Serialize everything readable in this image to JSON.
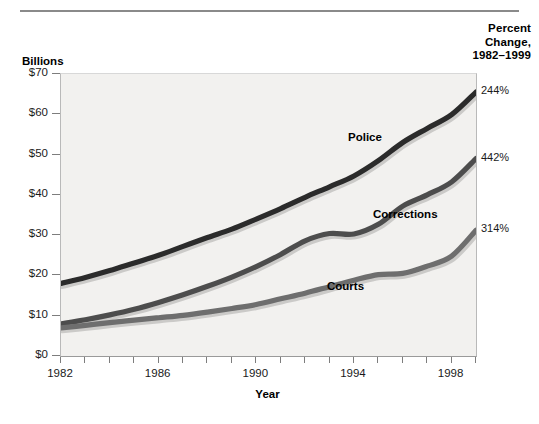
{
  "header": {
    "corner_title_line1": "Percent",
    "corner_title_line2": "Change,",
    "corner_title_line3": "1982–1999"
  },
  "axes": {
    "y_axis_title": "Billions",
    "x_axis_title": "Year",
    "y_tick_labels": [
      "$70",
      "$60",
      "$50",
      "$40",
      "$30",
      "$20",
      "$10",
      "$0"
    ],
    "x_tick_labels": [
      "1982",
      "1986",
      "1990",
      "1994",
      "1998"
    ]
  },
  "series_labels": {
    "police": "Police",
    "corrections": "Corrections",
    "courts": "Courts"
  },
  "percent_change": {
    "police": "244%",
    "corrections": "442%",
    "courts": "314%"
  },
  "colors": {
    "police": "#2b2b2b",
    "corrections": "#4d4d4d",
    "courts": "#6e6e6e",
    "plot_background": "#f2f1ef",
    "rule": "#8a8a8a"
  },
  "chart_data": {
    "type": "line",
    "title": "",
    "xlabel": "Year",
    "ylabel": "Billions",
    "xlim": [
      1982,
      1999
    ],
    "ylim": [
      0,
      70
    ],
    "grid": false,
    "legend": "inline-labels",
    "x": [
      1982,
      1983,
      1984,
      1985,
      1986,
      1987,
      1988,
      1989,
      1990,
      1991,
      1992,
      1993,
      1994,
      1995,
      1996,
      1997,
      1998,
      1999
    ],
    "series": [
      {
        "name": "Police",
        "percent_change_1982_1999": "244%",
        "color": "#2b2b2b",
        "values": [
          18.0,
          19.5,
          21.2,
          23.1,
          25.0,
          27.2,
          29.4,
          31.5,
          34.0,
          36.6,
          39.4,
          42.0,
          44.7,
          48.5,
          53.0,
          56.5,
          59.9,
          65.5
        ]
      },
      {
        "name": "Corrections",
        "percent_change_1982_1999": "442%",
        "color": "#4d4d4d",
        "values": [
          8.0,
          9.0,
          10.2,
          11.6,
          13.3,
          15.2,
          17.3,
          19.6,
          22.2,
          25.2,
          28.6,
          30.4,
          30.3,
          32.7,
          37.2,
          40.0,
          43.2,
          49.0
        ]
      },
      {
        "name": "Courts",
        "percent_change_1982_1999": "314%",
        "color": "#6e6e6e",
        "values": [
          7.0,
          7.6,
          8.3,
          8.9,
          9.5,
          10.1,
          10.9,
          11.8,
          12.8,
          14.2,
          15.6,
          17.2,
          18.8,
          20.2,
          20.5,
          22.3,
          24.8,
          31.2
        ]
      }
    ]
  }
}
